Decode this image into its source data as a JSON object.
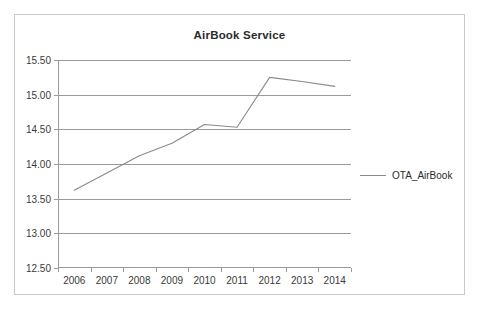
{
  "chart_data": {
    "type": "line",
    "title": "AirBook Service",
    "xlabel": "",
    "ylabel": "",
    "categories": [
      "2006",
      "2007",
      "2008",
      "2009",
      "2010",
      "2011",
      "2012",
      "2013",
      "2014"
    ],
    "series": [
      {
        "name": "OTA_AirBook",
        "color": "#8a8a8a",
        "values": [
          13.62,
          13.87,
          14.12,
          14.3,
          14.57,
          14.53,
          15.25,
          15.19,
          15.12
        ]
      }
    ],
    "ylim": [
      12.5,
      15.5
    ],
    "ytick_step": 0.5,
    "ytick_labels": [
      "15.50",
      "15.00",
      "14.50",
      "14.00",
      "13.50",
      "13.00",
      "12.50"
    ],
    "ytick_values": [
      15.5,
      15.0,
      14.5,
      14.0,
      13.5,
      13.0,
      12.5
    ],
    "grid": true,
    "grid_color": "#9a9a9a",
    "legend_position": "right",
    "plot_background": "#ffffff",
    "border_color": "#c9c9c9",
    "text_color": "#3a3a3a"
  },
  "legend": {
    "entries": [
      {
        "label": "OTA_AirBook",
        "marker": "line-swatch"
      }
    ]
  }
}
